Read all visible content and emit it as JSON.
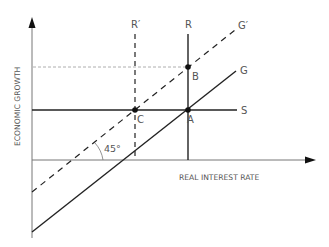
{
  "diagram": {
    "axes": {
      "x_label": "REAL INTEREST RATE",
      "y_label": "ECONOMIC GROWTH"
    },
    "lines": {
      "r_prime": "R′",
      "r": "R",
      "g_prime": "G′",
      "g": "G",
      "s": "S"
    },
    "points": {
      "a": "A",
      "b": "B",
      "c": "C"
    },
    "angle_label": "45°",
    "colors": {
      "line": "#222222",
      "axis": "#777777",
      "text": "#555555",
      "guide": "#999999"
    }
  }
}
